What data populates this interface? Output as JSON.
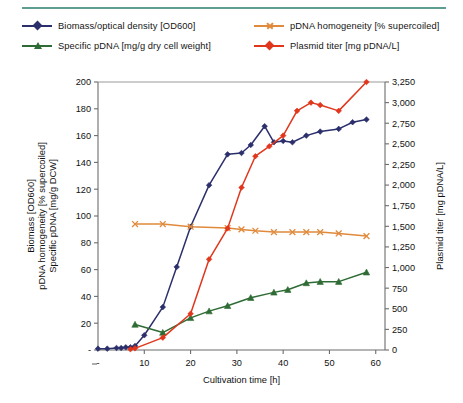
{
  "figure": {
    "rule_color": "#5e9e92",
    "background": "#ffffff"
  },
  "legend": {
    "position": "top",
    "items": [
      {
        "label": "Biomass/optical density [OD600]",
        "color": "#2b2f6b",
        "marker": "diamond"
      },
      {
        "label": "Specific pDNA [mg/g dry cell weight]",
        "color": "#2f6b34",
        "marker": "triangle"
      },
      {
        "label": "pDNA homogeneity [% supercoiled]",
        "color": "#e08a3c",
        "marker": "x"
      },
      {
        "label": "Plasmid titer [mg pDNA/L]",
        "color": "#e0361c",
        "marker": "diamond"
      }
    ]
  },
  "chart_data": {
    "type": "line",
    "title": "",
    "xlabel": "Cultivation time [h]",
    "ylabel": "Biomass [OD600]\npDNA homogeneity [% supercoiled]\nSpecific pDNA [mg/g DCW]",
    "ylabel_lines": [
      "Biomass [OD600]",
      "pDNA homogeneity [% supercoiled]",
      "Specific pDNA [mg/g DCW]"
    ],
    "y2label": "Plasmid titer [mg pDNA/L]",
    "xlim": [
      0,
      62
    ],
    "ylim": [
      0,
      200
    ],
    "y2lim": [
      0,
      3250
    ],
    "grid": false,
    "xticks": [
      0,
      10,
      20,
      30,
      40,
      50,
      60
    ],
    "xticklabels": [
      "-",
      "10",
      "20",
      "30",
      "40",
      "50",
      "60"
    ],
    "yticks": [
      0,
      20,
      40,
      60,
      80,
      100,
      120,
      140,
      160,
      180,
      200
    ],
    "yticklabels": [
      "-",
      "20",
      "40",
      "60",
      "80",
      "100",
      "120",
      "140",
      "160",
      "180",
      "200"
    ],
    "y2ticks": [
      0,
      250,
      500,
      750,
      1000,
      1250,
      1500,
      1750,
      2000,
      2250,
      2500,
      2750,
      3000,
      3250
    ],
    "y2ticklabels": [
      "0",
      "250",
      "500",
      "750",
      "1,000",
      "1,250",
      "1,500",
      "1,750",
      "2,000",
      "2,250",
      "2,500",
      "2,750",
      "3,000",
      "3,250"
    ],
    "series": [
      {
        "name": "Biomass/optical density [OD600]",
        "color": "#2b2f6b",
        "marker": "diamond",
        "axis": "left",
        "x": [
          0,
          2,
          4,
          5,
          6,
          7,
          8,
          10,
          14,
          17,
          20,
          24,
          28,
          31,
          33,
          36,
          38,
          40,
          42,
          45,
          48,
          52,
          55,
          58
        ],
        "y": [
          1,
          1,
          1.5,
          1.5,
          2,
          2,
          3,
          11,
          32,
          62,
          92,
          123,
          146,
          147,
          153,
          167,
          155,
          156,
          155,
          160,
          163,
          165,
          170,
          172
        ]
      },
      {
        "name": "Specific pDNA [mg/g dry cell weight]",
        "color": "#2f6b34",
        "marker": "triangle",
        "axis": "left",
        "x": [
          8,
          14,
          20,
          24,
          28,
          33,
          38,
          41,
          45,
          48,
          52,
          58
        ],
        "y": [
          19,
          13,
          24,
          29,
          33,
          39,
          43,
          45,
          50,
          51,
          51,
          58
        ]
      },
      {
        "name": "pDNA homogeneity [% supercoiled]",
        "color": "#e08a3c",
        "marker": "x",
        "axis": "left",
        "x": [
          8,
          14,
          20,
          28,
          31,
          34,
          38,
          42,
          45,
          48,
          52,
          58
        ],
        "y": [
          94,
          94,
          92,
          91,
          90,
          89,
          88,
          88,
          88,
          88,
          87,
          85
        ]
      },
      {
        "name": "Plasmid titer [mg pDNA/L]",
        "color": "#e0361c",
        "marker": "diamond",
        "axis": "right",
        "x": [
          7,
          8,
          14,
          20,
          24,
          28,
          31,
          34,
          37,
          40,
          43,
          46,
          48,
          52,
          58
        ],
        "y": [
          10,
          20,
          150,
          440,
          1100,
          1475,
          1970,
          2350,
          2470,
          2600,
          2900,
          3000,
          2970,
          2900,
          3250
        ]
      }
    ]
  }
}
